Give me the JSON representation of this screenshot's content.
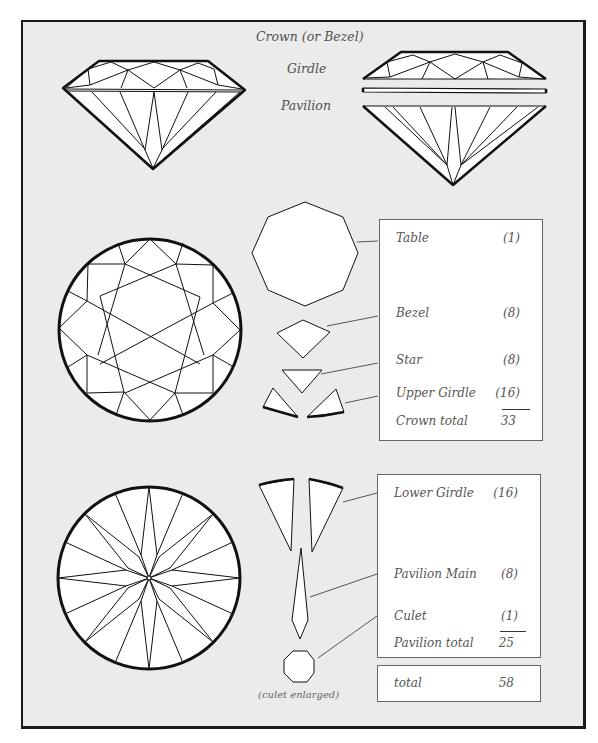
{
  "profile_labels": {
    "crown": "Crown (or Bezel)",
    "girdle": "Girdle",
    "pavilion": "Pavilion"
  },
  "crown_facets": {
    "items": [
      {
        "name": "Table",
        "count": "(1)"
      },
      {
        "name": "Bezel",
        "count": "(8)"
      },
      {
        "name": "Star",
        "count": "(8)"
      },
      {
        "name": "Upper Girdle",
        "count": "(16)"
      }
    ],
    "total_label": "Crown total",
    "total_value": "33"
  },
  "pavilion_facets": {
    "items": [
      {
        "name": "Lower Girdle",
        "count": "(16)"
      },
      {
        "name": "Pavilion Main",
        "count": "(8)"
      },
      {
        "name": "Culet",
        "count": "(1)"
      }
    ],
    "total_label": "Pavilion total",
    "total_value": "25"
  },
  "grand_total": {
    "label": "total",
    "value": "58"
  },
  "culet_caption": "(culet enlarged)",
  "colors": {
    "background": "#ebebeb",
    "facet_fill": "#ffffff",
    "outline": "#111111",
    "text": "#555555"
  }
}
